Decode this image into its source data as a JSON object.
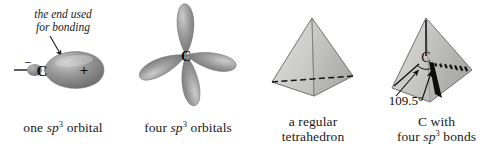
{
  "figure": {
    "panels": [
      {
        "id": "one-orbital",
        "annotation_line1": "the end used",
        "annotation_line2": "for bonding",
        "atom_label": "C",
        "sign_back": "–",
        "sign_front": "+",
        "caption_line1_pre": "one ",
        "caption_italic": "sp",
        "caption_sup": "3",
        "caption_line1_post": " orbital"
      },
      {
        "id": "four-orbitals",
        "atom_label": "C",
        "caption_line1_pre": "four ",
        "caption_italic": "sp",
        "caption_sup": "3",
        "caption_line1_post": " orbitals"
      },
      {
        "id": "tetrahedron",
        "caption_line1": "a regular",
        "caption_line2": "tetrahedron"
      },
      {
        "id": "c-bonds",
        "atom_label": "C",
        "angle_label": "109.5°",
        "caption_line1": "C with",
        "caption_line2_pre": "four ",
        "caption_italic": "sp",
        "caption_sup": "3",
        "caption_line2_post": " bonds"
      }
    ]
  },
  "colors": {
    "background": "#ffffff",
    "ink": "#1a1a1a",
    "orbital_mid": "#8f8f8f",
    "orbital_dark": "#5e5e5e",
    "orbital_light": "#c9c9c9",
    "solid_face_light": "#d8d8d6",
    "solid_face_mid": "#c2c2c0",
    "solid_face_dark": "#a9a9a7"
  }
}
